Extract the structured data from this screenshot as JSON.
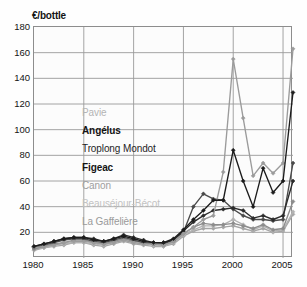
{
  "chart_data": {
    "type": "line",
    "title": "",
    "subtitle": "",
    "xlabel": "",
    "ylabel": "€/bottle",
    "y_unit_label": "€/bottle",
    "xlim": [
      1980,
      2006
    ],
    "ylim": [
      0,
      180
    ],
    "ytick_values": [
      20,
      40,
      60,
      80,
      100,
      120,
      140,
      160,
      180
    ],
    "ytick_labels": [
      "20",
      "40",
      "60",
      "80",
      "100",
      "120",
      "140",
      "160",
      "180"
    ],
    "xtick_values": [
      1980,
      1985,
      1990,
      1995,
      2000,
      2005
    ],
    "xtick_labels": [
      "1980",
      "1985",
      "1990",
      "1995",
      "2000",
      "2005"
    ],
    "grid": "both",
    "grid_color": "#9a9a9a",
    "plot_bg": "#fcfcfc",
    "frame_color": "#8d8d8d",
    "legend_position": "inside-center-left",
    "marker": "diamond",
    "x": [
      1980,
      1981,
      1982,
      1983,
      1984,
      1985,
      1986,
      1987,
      1988,
      1989,
      1990,
      1991,
      1992,
      1993,
      1994,
      1995,
      1996,
      1997,
      1998,
      1999,
      2000,
      2001,
      2002,
      2003,
      2004,
      2005,
      2006
    ],
    "series": [
      {
        "name": "Pavie",
        "color": "#9b9b9b",
        "label_color": "#b4b4b4",
        "values": [
          8,
          9,
          10,
          12,
          13,
          13,
          12,
          11,
          12,
          14,
          12,
          11,
          11,
          10,
          13,
          19,
          24,
          30,
          33,
          67,
          155,
          109,
          64,
          74,
          66,
          74,
          163
        ]
      },
      {
        "name": "Angélus",
        "color": "#1c1c1c",
        "label_color": "#141414",
        "values": [
          9,
          11,
          13,
          15,
          16,
          16,
          14,
          13,
          15,
          17,
          15,
          13,
          12,
          12,
          15,
          22,
          30,
          37,
          45,
          45,
          84,
          60,
          40,
          70,
          51,
          60,
          129
        ]
      },
      {
        "name": "Troplong Mondot",
        "color": "#4a4a4a",
        "label_color": "#1f1f1f",
        "values": [
          8,
          10,
          12,
          14,
          15,
          15,
          13,
          12,
          14,
          16,
          14,
          12,
          11,
          11,
          14,
          20,
          40,
          50,
          46,
          45,
          38,
          33,
          30,
          30,
          29,
          30,
          74
        ]
      },
      {
        "name": "Figeac",
        "color": "#2b2b2b",
        "label_color": "#141414",
        "values": [
          9,
          11,
          13,
          15,
          16,
          16,
          15,
          13,
          15,
          18,
          16,
          14,
          12,
          12,
          14,
          21,
          28,
          33,
          37,
          38,
          39,
          37,
          31,
          33,
          30,
          33,
          60
        ]
      },
      {
        "name": "Canon",
        "color": "#8c8c8c",
        "label_color": "#9e9e9e",
        "values": [
          7,
          9,
          11,
          12,
          14,
          14,
          12,
          11,
          13,
          15,
          13,
          12,
          11,
          10,
          13,
          19,
          24,
          27,
          26,
          26,
          27,
          25,
          23,
          26,
          22,
          23,
          44
        ]
      },
      {
        "name": "Beauséjour-Bécot",
        "color": "#b2b2b2",
        "label_color": "#c2c2c2",
        "values": [
          7,
          8,
          10,
          11,
          12,
          12,
          11,
          10,
          12,
          14,
          12,
          11,
          10,
          9,
          12,
          18,
          22,
          25,
          25,
          26,
          30,
          26,
          22,
          25,
          21,
          22,
          36
        ]
      },
      {
        "name": "La Gaffelière",
        "color": "#a5a5a5",
        "label_color": "#9a9a9a",
        "values": [
          6,
          8,
          9,
          10,
          12,
          12,
          10,
          9,
          11,
          13,
          11,
          10,
          9,
          9,
          11,
          17,
          21,
          23,
          23,
          24,
          25,
          23,
          21,
          23,
          20,
          21,
          34
        ]
      }
    ],
    "legend_entries": [
      {
        "label": "Pavie",
        "color": "#b4b4b4",
        "weight": "normal"
      },
      {
        "label": "Angélus",
        "color": "#141414",
        "weight": "bold"
      },
      {
        "label": "Troplong Mondot",
        "color": "#1f1f1f",
        "weight": "normal"
      },
      {
        "label": "Figeac",
        "color": "#141414",
        "weight": "bold"
      },
      {
        "label": "Canon",
        "color": "#9e9e9e",
        "weight": "normal"
      },
      {
        "label": "Beauséjour-Bécot",
        "color": "#c2c2c2",
        "weight": "normal"
      },
      {
        "label": "La Gaffelière",
        "color": "#9a9a9a",
        "weight": "normal"
      }
    ]
  }
}
